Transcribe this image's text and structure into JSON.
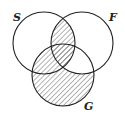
{
  "diagram": {
    "type": "venn",
    "sets": [
      {
        "id": "S",
        "label": "S",
        "cx": 44,
        "cy": 43,
        "r": 31,
        "label_x": 13,
        "label_y": 21
      },
      {
        "id": "F",
        "label": "F",
        "cx": 82,
        "cy": 43,
        "r": 31,
        "label_x": 109,
        "label_y": 21
      },
      {
        "id": "G",
        "label": "G",
        "cx": 63,
        "cy": 75,
        "r": 31,
        "label_x": 84,
        "label_y": 110
      }
    ],
    "shaded_regions": [
      "S∩F∩¬G",
      "S∩F∩G",
      "S∩G∩¬F",
      "G∩¬S∩¬F"
    ],
    "unshaded_regions": [
      "S only",
      "F only",
      "F∩G∩¬S"
    ],
    "stroke_color": "#222222",
    "hatch_color": "#555555"
  }
}
